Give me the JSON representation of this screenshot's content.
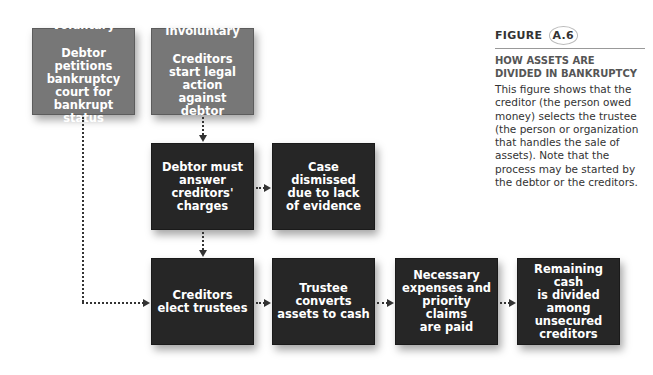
{
  "figure": {
    "label": "FIGURE",
    "number": "A.6",
    "title": "HOW ASSETS ARE DIVIDED IN BANKRUPTCY",
    "description": "This figure shows that the creditor (the person owed money) selects the trustee (the person or organization that handles the sale of assets). Note that the process may be started by the debtor or the creditors."
  },
  "nodes": {
    "voluntary": {
      "title": "Voluntary",
      "text": "Debtor petitions\nbankruptcy\ncourt for\nbankrupt status"
    },
    "involuntary": {
      "title": "Involuntary",
      "text": "Creditors\nstart legal action\nagainst debtor"
    },
    "debtor_answer": {
      "text": "Debtor must\nanswer\ncreditors'\ncharges"
    },
    "dismissed": {
      "text": "Case dismissed\ndue to lack\nof evidence"
    },
    "elect": {
      "text": "Creditors\nelect trustees"
    },
    "convert": {
      "text": "Trustee converts\nassets to cash"
    },
    "expenses": {
      "text": "Necessary\nexpenses and\npriority claims\nare paid"
    },
    "remaining": {
      "text": "Remaining cash\nis divided\namong\nunsecured\ncreditors"
    }
  },
  "colors": {
    "gray_box": "#777777",
    "dark_box": "#262626",
    "connector": "#333333"
  }
}
